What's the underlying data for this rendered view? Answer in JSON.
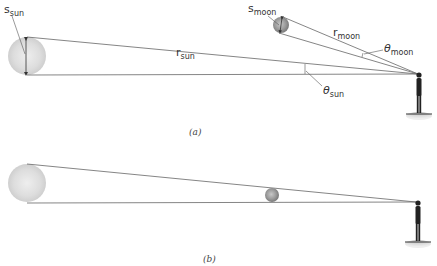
{
  "panels": [
    {
      "id": "a",
      "caption": "(a)",
      "labels": {
        "s_sun": {
          "main": "s",
          "sub": "sun"
        },
        "r_sun": {
          "main": "r",
          "sub": "sun"
        },
        "theta_sun": {
          "main": "θ",
          "sub": "sun"
        },
        "s_moon": {
          "main": "s",
          "sub": "moon"
        },
        "r_moon": {
          "main": "r",
          "sub": "moon"
        },
        "theta_moon": {
          "main": "θ",
          "sub": "moon"
        }
      }
    },
    {
      "id": "b",
      "caption": "(b)"
    }
  ],
  "colors": {
    "sun_fill": "#dcdcdc",
    "moon_fill": "#9a9a9a",
    "line": "#666666",
    "figure": "#222222"
  }
}
